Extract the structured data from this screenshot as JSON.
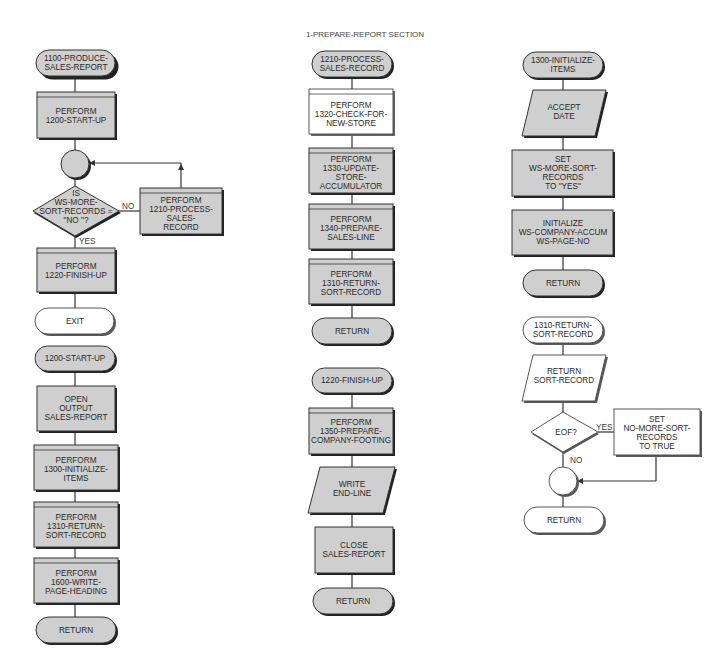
{
  "title": "1-PREPARE-REPORT SECTION",
  "colors": {
    "shape_fill_gray": "#cfcfcf",
    "shape_fill_white": "#ffffff",
    "stroke": "#333333"
  },
  "columns": [
    {
      "name": "1100-produce-sales-report",
      "nodes": [
        {
          "type": "terminal",
          "lines": [
            "1100-PRODUCE-",
            "SALES-REPORT"
          ]
        },
        {
          "type": "predefined-process",
          "lines": [
            "PERFORM",
            "1200-START-UP"
          ]
        },
        {
          "type": "connector",
          "lines": []
        },
        {
          "type": "decision",
          "lines": [
            "IS",
            "WS-MORE-",
            "SORT-RECORDS =",
            "\"NO \"?"
          ]
        },
        {
          "type": "predefined-process",
          "lines": [
            "PERFORM",
            "1210-PROCESS-",
            "SALES-",
            "RECORD"
          ]
        },
        {
          "type": "predefined-process",
          "lines": [
            "PERFORM",
            "1220-FINISH-UP"
          ]
        },
        {
          "type": "terminal",
          "style": "white",
          "lines": [
            "EXIT"
          ]
        }
      ],
      "labels": {
        "no": "NO",
        "yes": "YES"
      }
    },
    {
      "name": "1200-start-up",
      "nodes": [
        {
          "type": "terminal",
          "lines": [
            "1200-START-UP"
          ]
        },
        {
          "type": "process",
          "lines": [
            "OPEN",
            "OUTPUT",
            "SALES-REPORT"
          ]
        },
        {
          "type": "predefined-process",
          "lines": [
            "PERFORM",
            "1300-INITIALIZE-",
            "ITEMS"
          ]
        },
        {
          "type": "predefined-process",
          "lines": [
            "PERFORM",
            "1310-RETURN-",
            "SORT-RECORD"
          ]
        },
        {
          "type": "predefined-process",
          "lines": [
            "PERFORM",
            "1600-WRITE-",
            "PAGE-HEADING"
          ]
        },
        {
          "type": "terminal",
          "lines": [
            "RETURN"
          ]
        }
      ]
    },
    {
      "name": "1210-process-sales-record",
      "nodes": [
        {
          "type": "terminal",
          "lines": [
            "1210-PROCESS-",
            "SALES-RECORD"
          ]
        },
        {
          "type": "predefined-process",
          "style": "white",
          "lines": [
            "PERFORM",
            "1320-CHECK-FOR-",
            "NEW-STORE"
          ]
        },
        {
          "type": "predefined-process",
          "lines": [
            "PERFORM",
            "1330-UPDATE-",
            "STORE-",
            "ACCUMULATOR"
          ]
        },
        {
          "type": "predefined-process",
          "lines": [
            "PERFORM",
            "1340-PREPARE-",
            "SALES-LINE"
          ]
        },
        {
          "type": "predefined-process",
          "lines": [
            "PERFORM",
            "1310-RETURN-",
            "SORT-RECORD"
          ]
        },
        {
          "type": "terminal",
          "lines": [
            "RETURN"
          ]
        }
      ]
    },
    {
      "name": "1220-finish-up",
      "nodes": [
        {
          "type": "terminal",
          "lines": [
            "1220-FINISH-UP"
          ]
        },
        {
          "type": "predefined-process",
          "lines": [
            "PERFORM",
            "1350-PREPARE-",
            "COMPANY-FOOTING"
          ]
        },
        {
          "type": "io",
          "lines": [
            "WRITE",
            "END-LINE"
          ]
        },
        {
          "type": "process",
          "lines": [
            "CLOSE",
            "SALES-REPORT"
          ]
        },
        {
          "type": "terminal",
          "lines": [
            "RETURN"
          ]
        }
      ]
    },
    {
      "name": "1300-initialize-items",
      "nodes": [
        {
          "type": "terminal",
          "lines": [
            "1300-INITIALIZE-",
            "ITEMS"
          ]
        },
        {
          "type": "io",
          "lines": [
            "ACCEPT",
            "DATE"
          ]
        },
        {
          "type": "process",
          "lines": [
            "SET",
            "WS-MORE-SORT-",
            "RECORDS",
            "TO \"YES\""
          ]
        },
        {
          "type": "process",
          "lines": [
            "INITIALIZE",
            "WS-COMPANY-ACCUM",
            "WS-PAGE-NO"
          ]
        },
        {
          "type": "terminal",
          "lines": [
            "RETURN"
          ]
        }
      ]
    },
    {
      "name": "1310-return-sort-record",
      "nodes": [
        {
          "type": "terminal",
          "style": "white",
          "lines": [
            "1310-RETURN-",
            "SORT-RECORD"
          ]
        },
        {
          "type": "io",
          "style": "white",
          "lines": [
            "RETURN",
            "SORT-RECORD"
          ]
        },
        {
          "type": "decision",
          "style": "white",
          "lines": [
            "EOF?"
          ]
        },
        {
          "type": "process",
          "style": "white",
          "lines": [
            "SET",
            "NO-MORE-SORT-",
            "RECORDS",
            "TO TRUE"
          ]
        },
        {
          "type": "connector",
          "style": "white",
          "lines": []
        },
        {
          "type": "terminal",
          "style": "white",
          "lines": [
            "RETURN"
          ]
        }
      ],
      "labels": {
        "yes": "YES",
        "no": "NO"
      }
    }
  ]
}
